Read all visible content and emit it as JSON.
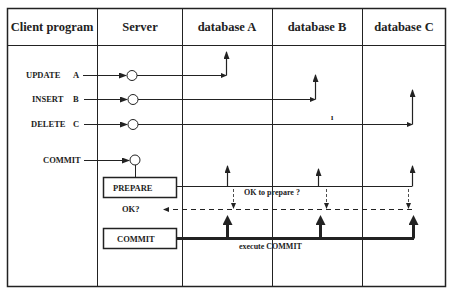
{
  "columns": [
    {
      "label": "Client program"
    },
    {
      "label": "Server"
    },
    {
      "label": "database A"
    },
    {
      "label": "database B"
    },
    {
      "label": "database C"
    }
  ],
  "operations": [
    {
      "label": "UPDATE",
      "target": "A"
    },
    {
      "label": "INSERT",
      "target": "B"
    },
    {
      "label": "DELETE",
      "target": "C"
    }
  ],
  "commit_request": {
    "label": "COMMIT"
  },
  "server_boxes": {
    "prepare": "PREPARE",
    "ok_query": "OK?",
    "commit": "COMMIT"
  },
  "messages": {
    "ok_to_prepare": "OK  to prepare ?",
    "execute_commit": "execute  COMMIT",
    "stray_mark": "ı"
  },
  "colors": {
    "line": "#222222",
    "background": "#ffffff"
  }
}
